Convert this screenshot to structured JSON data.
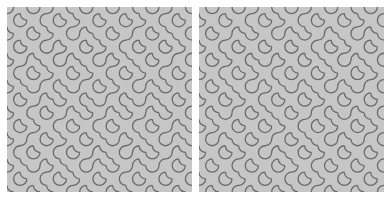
{
  "style": {
    "page_background": "#ffffff",
    "tile_background": "#c6c6c6",
    "stroke_color": "#6a6a6a",
    "stroke_width": 1.3
  },
  "panels": [
    {
      "id": "left",
      "name": "truchet-pattern-left",
      "cols": 14,
      "rows": 14,
      "grid": [
        "ABAABBABABBAAB",
        "BABBAABABAABBA",
        "ABAABABBAABABB",
        "BABAABAABBABAA",
        "AABBABBAABBAAB",
        "BBAABAABBAABBA",
        "ABABBABAABABAB",
        "BAABABBABBABBA",
        "ABBAABAABAABAB",
        "BAABBABBABBAAB",
        "AABAABABAABBAB",
        "BBABBAABBABAAB",
        "ABAABBABAABABA",
        "BABBAABABBABAB"
      ]
    },
    {
      "id": "right",
      "name": "truchet-pattern-right",
      "cols": 14,
      "rows": 14,
      "grid": [
        "BABAABBAABABBA",
        "ABABBAABBABAAB",
        "BAABABABAABBAB",
        "ABBABABABBAABA",
        "BAABBAABABBABB",
        "ABBAABBABAABAA",
        "BABBAABABBABAB",
        "ABAABBABAABABA",
        "BBABABBAABBABB",
        "AABABAABBAABAA",
        "BABBAABABBABAB",
        "ABAABABBAABABA",
        "BABBABAABBABAB",
        "ABAABABBAABABA"
      ]
    }
  ]
}
